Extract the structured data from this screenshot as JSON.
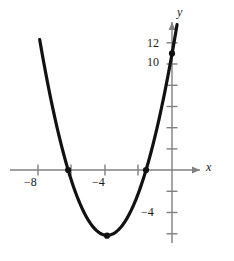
{
  "chart_data": {
    "type": "line",
    "title": "",
    "subtitle": "",
    "xlabel": "x",
    "ylabel": "y",
    "grid": false,
    "legend": null,
    "xlim": [
      -9.8,
      3.2
    ],
    "ylim": [
      -7.5,
      13.6
    ],
    "x_ticks": [
      -8,
      -6,
      -4,
      -2
    ],
    "x_tick_labels": [
      "−8",
      "",
      "−4",
      ""
    ],
    "y_ticks": [
      12,
      10,
      8,
      6,
      4,
      2,
      -2,
      -4,
      -6
    ],
    "y_tick_labels": [
      "12",
      "10",
      "",
      "",
      "",
      "",
      "",
      "−4",
      ""
    ],
    "curve": {
      "name": "parabola",
      "equation_form": "y = a(x - r1)(x - r2)",
      "a": 1.14,
      "roots": [
        -6.2,
        -1.55
      ],
      "vertex": [
        -3.88,
        -6.2
      ],
      "y_intercept": 11,
      "color": "#111111",
      "line_width": 3,
      "x_domain": [
        -7.9,
        0.3
      ]
    },
    "marked_points": [
      {
        "label": "left x-intercept",
        "x": -6.2,
        "y": 0
      },
      {
        "label": "right x-intercept",
        "x": -1.55,
        "y": 0
      },
      {
        "label": "vertex",
        "x": -3.88,
        "y": -6.2
      },
      {
        "label": "y-intercept",
        "x": 0,
        "y": 11
      }
    ],
    "axis_color": "#808080",
    "text_color": "#1a1a1a",
    "background": "#ffffff"
  },
  "labels": {
    "x_axis_name": "x",
    "y_axis_name": "y",
    "x_tick_neg8": "−8",
    "x_tick_neg4": "−4",
    "y_tick_12": "12",
    "y_tick_10": "10",
    "y_tick_neg4": "−4"
  }
}
